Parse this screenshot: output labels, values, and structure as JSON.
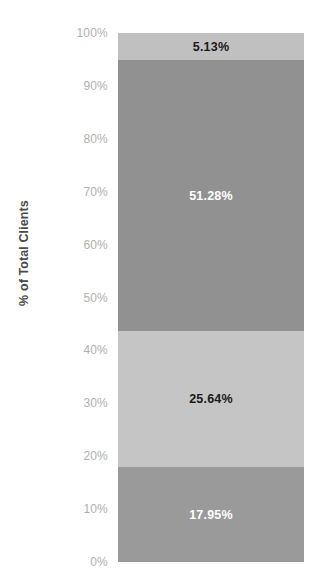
{
  "chart_data": {
    "type": "bar",
    "subtype": "100-percent-stacked-bar",
    "title": "",
    "subtitle": "",
    "xlabel": "",
    "ylabel": "% of Total Clients",
    "ylim": [
      0,
      100
    ],
    "grid": false,
    "legend": "none",
    "orientation": "vertical",
    "categories": [
      ""
    ],
    "series": [
      {
        "name": "Segment 1",
        "values": [
          17.95
        ],
        "label": "17.95%",
        "color": "#9a9a9a",
        "label_color": "#ffffff",
        "stack_order": 1
      },
      {
        "name": "Segment 2",
        "values": [
          25.64
        ],
        "label": "25.64%",
        "color": "#c5c5c5",
        "label_color": "#1a1a1a",
        "stack_order": 2
      },
      {
        "name": "Segment 3",
        "values": [
          51.28
        ],
        "label": "51.28%",
        "color": "#919191",
        "label_color": "#ffffff",
        "stack_order": 3
      },
      {
        "name": "Segment 4",
        "values": [
          5.13
        ],
        "label": "5.13%",
        "color": "#c0c0c0",
        "label_color": "#1a1a1a",
        "stack_order": 4
      }
    ],
    "stack_top_to_bottom": [
      {
        "label": "5.13%",
        "value": 5.13,
        "color": "#c0c0c0",
        "label_color": "#1a1a1a"
      },
      {
        "label": "51.28%",
        "value": 51.28,
        "color": "#919191",
        "label_color": "#ffffff"
      },
      {
        "label": "25.64%",
        "value": 25.64,
        "color": "#c5c5c5",
        "label_color": "#1a1a1a"
      },
      {
        "label": "17.95%",
        "value": 17.95,
        "color": "#9a9a9a",
        "label_color": "#ffffff"
      }
    ],
    "yticks": [
      100,
      90,
      80,
      70,
      60,
      50,
      40,
      30,
      20,
      10,
      0
    ],
    "ytick_labels": [
      "100%",
      "90%",
      "80%",
      "70%",
      "60%",
      "50%",
      "40%",
      "30%",
      "20%",
      "10%",
      "0%"
    ]
  },
  "axis": {
    "y_title": "% of Total Clients",
    "ticks": [
      {
        "label": "100%",
        "value": 100
      },
      {
        "label": "90%",
        "value": 90
      },
      {
        "label": "80%",
        "value": 80
      },
      {
        "label": "70%",
        "value": 70
      },
      {
        "label": "60%",
        "value": 60
      },
      {
        "label": "50%",
        "value": 50
      },
      {
        "label": "40%",
        "value": 40
      },
      {
        "label": "30%",
        "value": 30
      },
      {
        "label": "20%",
        "value": 20
      },
      {
        "label": "10%",
        "value": 10
      },
      {
        "label": "0%",
        "value": 0
      }
    ],
    "tick_color": "#b0b0b0",
    "title_color": "#4a4a4a"
  },
  "bar": {
    "segments": [
      {
        "label": "5.13%",
        "value": 5.13,
        "fill": "#c0c0c0",
        "text_color": "#1a1a1a"
      },
      {
        "label": "51.28%",
        "value": 51.28,
        "fill": "#919191",
        "text_color": "#ffffff"
      },
      {
        "label": "25.64%",
        "value": 25.64,
        "fill": "#c5c5c5",
        "text_color": "#1a1a1a"
      },
      {
        "label": "17.95%",
        "value": 17.95,
        "fill": "#9a9a9a",
        "text_color": "#ffffff"
      }
    ]
  },
  "theme": {
    "background": "#ffffff"
  }
}
